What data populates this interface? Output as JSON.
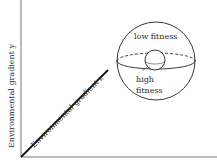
{
  "diagram": {
    "axes": {
      "y_label": "Environmental gradient y",
      "z_label": "Environmental gradient z",
      "x_label": ""
    },
    "sphere": {
      "top_label": "low fitness",
      "bottom_label_line1": "high",
      "bottom_label_line2": "fitness"
    },
    "colors": {
      "line": "#1a1a1a",
      "text": "#2a2a2a",
      "background": "#ffffff"
    }
  }
}
